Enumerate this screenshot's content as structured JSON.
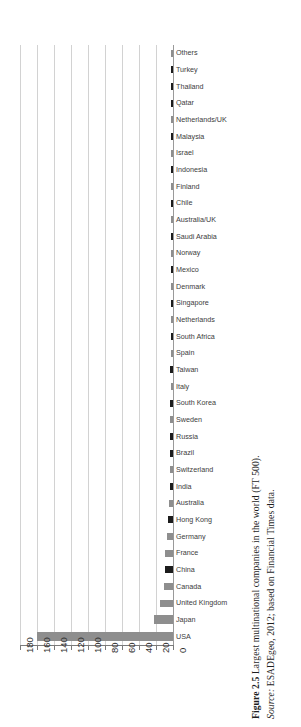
{
  "figure": {
    "number": "Figure 2.5",
    "title": "Largest multinational companies in the world (FT 500).",
    "source_lead": "Source:",
    "source_text": "ESADEgeo, 2012; based on Financial Times data."
  },
  "chart_data": {
    "type": "bar",
    "orientation": "horizontal",
    "title": "Largest multinational companies in the world (FT 500)",
    "xlabel": "",
    "ylabel": "",
    "xlim": [
      180,
      0
    ],
    "x_axis_reversed": true,
    "grid": true,
    "legend": "none",
    "tick_labels": [
      "180",
      "160",
      "140",
      "120",
      "100",
      "80",
      "60",
      "40",
      "20",
      "0"
    ],
    "tick_values": [
      180,
      160,
      140,
      120,
      100,
      80,
      60,
      40,
      20,
      0
    ],
    "colors": {
      "dark": "#1c1c1c",
      "gray": "#8e8e8e"
    },
    "categories": [
      "Others",
      "Turkey",
      "Thailand",
      "Qatar",
      "Netherlands/UK",
      "Malaysia",
      "Israel",
      "Indonesia",
      "Finland",
      "Chile",
      "Australia/UK",
      "Saudi Arabia",
      "Norway",
      "Mexico",
      "Denmark",
      "Singapore",
      "Netherlands",
      "South Africa",
      "Spain",
      "Taiwan",
      "Italy",
      "South Korea",
      "Sweden",
      "Russia",
      "Brazil",
      "Switzerland",
      "India",
      "Australia",
      "Hong Kong",
      "Germany",
      "France",
      "China",
      "Canada",
      "United Kingdom",
      "Japan",
      "USA"
    ],
    "values": [
      2,
      1,
      1,
      1,
      1,
      1,
      1,
      1,
      1,
      1,
      1,
      2,
      1,
      2,
      1,
      2,
      2,
      2,
      2,
      3,
      2,
      3,
      3,
      3,
      3,
      4,
      4,
      5,
      6,
      7,
      9,
      10,
      11,
      15,
      22,
      160
    ],
    "bar_shades": [
      "gray",
      "dark",
      "dark",
      "dark",
      "gray",
      "dark",
      "gray",
      "dark",
      "gray",
      "dark",
      "gray",
      "dark",
      "gray",
      "dark",
      "gray",
      "dark",
      "gray",
      "dark",
      "gray",
      "dark",
      "gray",
      "dark",
      "gray",
      "dark",
      "dark",
      "gray",
      "dark",
      "gray",
      "dark",
      "gray",
      "gray",
      "dark",
      "gray",
      "gray",
      "gray",
      "gray"
    ]
  }
}
